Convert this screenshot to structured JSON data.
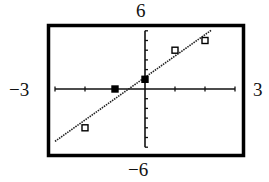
{
  "chart_data": {
    "type": "scatter",
    "title": "",
    "xlabel": "",
    "ylabel": "",
    "window": {
      "xmin": -3,
      "xmax": 3,
      "ymin": -6,
      "ymax": 6,
      "xscl": 1,
      "yscl": 1
    },
    "window_labels": {
      "ymax": "6",
      "ymin": "−6",
      "xmin": "−3",
      "xmax": "3"
    },
    "grid": false,
    "legend": null,
    "series": [
      {
        "name": "data points",
        "marker": "square",
        "points": [
          {
            "x": -2,
            "y": -4,
            "style": "hollow"
          },
          {
            "x": -1,
            "y": 0,
            "style": "filled"
          },
          {
            "x": 0,
            "y": 1,
            "style": "filled"
          },
          {
            "x": 1,
            "y": 4,
            "style": "hollow"
          },
          {
            "x": 2,
            "y": 5,
            "style": "hollow"
          }
        ]
      },
      {
        "name": "regression line",
        "type": "line",
        "style": "dotted",
        "slope": 2.2,
        "intercept": 1.2,
        "x_range": [
          -3,
          2.2
        ]
      }
    ]
  }
}
